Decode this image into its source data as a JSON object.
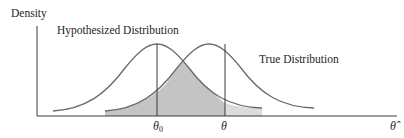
{
  "figure": {
    "y_axis_label": "Density",
    "x_axis_label": "θ̂",
    "curves": [
      {
        "name": "hypothesized",
        "label": "Hypothesized Distribution",
        "center_label": "θ",
        "center_sub": "0"
      },
      {
        "name": "true",
        "label": "True Distribution",
        "center_label": "θ"
      }
    ],
    "shaded_region": "overlap of hypothesized and true distributions",
    "colors": {
      "line": "#6a6a6a",
      "axis": "#3a3a3a",
      "shade_dark": "#c4c4c4",
      "shade_light": "#dcdcdc"
    }
  }
}
